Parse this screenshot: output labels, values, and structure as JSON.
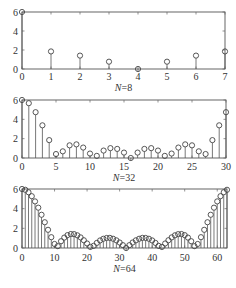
{
  "chart_data": [
    {
      "type": "stem",
      "title": "",
      "xlabel": "N=8",
      "xlabel_italic_part": "N",
      "xlabel_rest": "=8",
      "ylabel": "",
      "xlim": [
        0,
        7
      ],
      "ylim": [
        0,
        6
      ],
      "xticks": [
        0,
        1,
        2,
        3,
        4,
        5,
        6,
        7
      ],
      "yticks": [
        0,
        2,
        4,
        6
      ],
      "x": [
        0,
        1,
        2,
        3,
        4,
        5,
        6,
        7
      ],
      "values": [
        6,
        1.85,
        1.41,
        0.77,
        0,
        0.77,
        1.41,
        1.85
      ],
      "box": {
        "left": 22,
        "top": 12,
        "right": 225,
        "bottom": 69
      },
      "xtick_label_y": 80,
      "xlabel_y": 91
    },
    {
      "type": "stem",
      "title": "",
      "xlabel": "N=32",
      "xlabel_italic_part": "N",
      "xlabel_rest": "=32",
      "ylabel": "",
      "xlim": [
        0,
        30
      ],
      "ylim": [
        0,
        6
      ],
      "xticks": [
        0,
        5,
        10,
        15,
        20,
        25,
        30
      ],
      "yticks": [
        0,
        2,
        4,
        6
      ],
      "x": [
        0,
        1,
        2,
        3,
        4,
        5,
        6,
        7,
        8,
        9,
        10,
        11,
        12,
        13,
        14,
        15,
        16,
        17,
        18,
        19,
        20,
        21,
        22,
        23,
        24,
        25,
        26,
        27,
        28,
        29,
        30
      ],
      "values": [
        6,
        5.67,
        4.74,
        3.38,
        1.85,
        0.41,
        0.69,
        1.31,
        1.41,
        1.08,
        0.46,
        0.22,
        0.77,
        1.02,
        0.94,
        0.56,
        0,
        0.56,
        0.94,
        1.02,
        0.77,
        0.22,
        0.46,
        1.08,
        1.41,
        1.31,
        0.69,
        0.41,
        1.85,
        3.38,
        4.74
      ],
      "box": {
        "left": 22,
        "top": 100,
        "right": 226,
        "bottom": 158
      },
      "xtick_label_y": 170,
      "xlabel_y": 181
    },
    {
      "type": "stem",
      "title": "",
      "xlabel": "N=64",
      "xlabel_italic_part": "N",
      "xlabel_rest": "=64",
      "ylabel": "",
      "xlim": [
        0,
        63
      ],
      "ylim": [
        0,
        6
      ],
      "xticks": [
        0,
        10,
        20,
        30,
        40,
        50,
        60
      ],
      "yticks": [
        0,
        2,
        4,
        6
      ],
      "x": [
        0,
        1,
        2,
        3,
        4,
        5,
        6,
        7,
        8,
        9,
        10,
        11,
        12,
        13,
        14,
        15,
        16,
        17,
        18,
        19,
        20,
        21,
        22,
        23,
        24,
        25,
        26,
        27,
        28,
        29,
        30,
        31,
        32,
        33,
        34,
        35,
        36,
        37,
        38,
        39,
        40,
        41,
        42,
        43,
        44,
        45,
        46,
        47,
        48,
        49,
        50,
        51,
        52,
        53,
        54,
        55,
        56,
        57,
        58,
        59,
        60,
        61,
        62,
        63
      ],
      "values": [
        6,
        5.92,
        5.67,
        5.27,
        4.74,
        4.1,
        3.38,
        2.62,
        1.85,
        1.1,
        0.41,
        0.19,
        0.69,
        1.06,
        1.31,
        1.42,
        1.41,
        1.29,
        1.08,
        0.79,
        0.46,
        0.11,
        0.22,
        0.52,
        0.77,
        0.94,
        1.02,
        1.03,
        0.94,
        0.78,
        0.56,
        0.29,
        0,
        0.29,
        0.56,
        0.78,
        0.94,
        1.03,
        1.02,
        0.94,
        0.77,
        0.52,
        0.22,
        0.11,
        0.46,
        0.79,
        1.08,
        1.29,
        1.41,
        1.42,
        1.31,
        1.06,
        0.69,
        0.19,
        0.41,
        1.1,
        1.85,
        2.62,
        3.38,
        4.1,
        4.74,
        5.27,
        5.67,
        5.92
      ],
      "box": {
        "left": 22,
        "top": 189,
        "right": 227,
        "bottom": 248
      },
      "xtick_label_y": 261,
      "xlabel_y": 272
    }
  ],
  "style": {
    "axis_color": "#555555",
    "stem_color": "#555555",
    "marker_color": "#444444",
    "text_color": "#333333",
    "background": "#ffffff"
  }
}
